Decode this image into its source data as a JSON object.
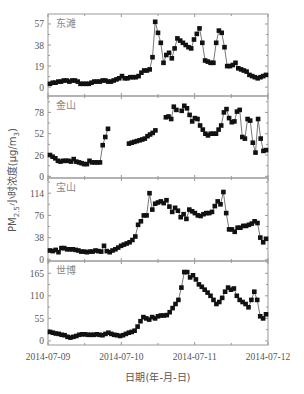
{
  "chart_data": {
    "type": "line",
    "title": "",
    "xlabel": "日期(年-月-日)",
    "ylabel": "PM2.5小时浓度(μg/m3)",
    "ylabel_parts": {
      "main": "PM",
      "sub": "2.5",
      "rest": "小时浓度(μg/m",
      "sub2": "3",
      "close": ")"
    },
    "x_ticks": [
      "2014-07-09",
      "2014-07-10",
      "2014-07-11",
      "2014-07-12"
    ],
    "x_range": [
      0,
      72
    ],
    "marker": "square",
    "grid": false,
    "panels": [
      {
        "name": "东滩",
        "yticks": [
          0,
          19,
          38,
          57
        ],
        "ylim": [
          -8,
          66
        ],
        "values": [
          3,
          4,
          4,
          5,
          5,
          6,
          6,
          5,
          6,
          6,
          5,
          3,
          3,
          3,
          3,
          4,
          5,
          5,
          5,
          6,
          6,
          5,
          5,
          6,
          7,
          8,
          10,
          8,
          8,
          9,
          9,
          9,
          10,
          13,
          15,
          15,
          16,
          27,
          59,
          49,
          40,
          22,
          29,
          31,
          26,
          35,
          44,
          42,
          40,
          38,
          36,
          35,
          43,
          48,
          53,
          40,
          24,
          23,
          22,
          22,
          40,
          51,
          49,
          36,
          19,
          19,
          20,
          22,
          17,
          16,
          15,
          14,
          11,
          10,
          9,
          8,
          9,
          10,
          11
        ]
      },
      {
        "name": "金山",
        "yticks": [
          0,
          26,
          52,
          78
        ],
        "ylim": [
          -2,
          98
        ],
        "values": [
          26,
          24,
          22,
          19,
          18,
          19,
          19,
          19,
          18,
          21,
          18,
          17,
          16,
          15,
          15,
          19,
          17,
          17,
          17,
          17,
          38,
          48,
          58,
          null,
          null,
          null,
          null,
          null,
          null,
          null,
          40,
          41,
          42,
          43,
          44,
          45,
          46,
          49,
          51,
          53,
          56,
          null,
          null,
          null,
          72,
          73,
          70,
          85,
          81,
          null,
          80,
          86,
          83,
          75,
          67,
          71,
          70,
          62,
          57,
          52,
          50,
          52,
          52,
          52,
          57,
          62,
          78,
          82,
          71,
          66,
          67,
          79,
          81,
          48,
          46,
          70,
          68,
          41,
          29,
          70,
          46,
          31,
          32
        ]
      },
      {
        "name": "宝山",
        "yticks": [
          0,
          38,
          76,
          114
        ],
        "ylim": [
          -2,
          140
        ],
        "values": [
          16,
          15,
          17,
          13,
          20,
          20,
          18,
          18,
          18,
          17,
          16,
          14,
          14,
          13,
          14,
          14,
          16,
          15,
          14,
          24,
          15,
          13,
          16,
          18,
          21,
          24,
          26,
          28,
          30,
          34,
          40,
          60,
          66,
          76,
          76,
          114,
          86,
          96,
          98,
          100,
          97,
          102,
          91,
          82,
          89,
          84,
          73,
          78,
          70,
          86,
          83,
          80,
          76,
          75,
          78,
          80,
          80,
          82,
          92,
          100,
          95,
          116,
          80,
          52,
          52,
          48,
          55,
          55,
          58,
          58,
          60,
          62,
          66,
          63,
          38,
          30,
          36
        ]
      },
      {
        "name": "世博",
        "yticks": [
          0,
          55,
          110,
          165
        ],
        "ylim": [
          -10,
          195
        ],
        "values": [
          22,
          20,
          18,
          17,
          15,
          14,
          10,
          8,
          10,
          12,
          15,
          16,
          16,
          15,
          15,
          15,
          16,
          15,
          14,
          17,
          20,
          17,
          15,
          14,
          12,
          14,
          17,
          20,
          22,
          25,
          35,
          48,
          58,
          55,
          52,
          58,
          55,
          60,
          62,
          62,
          63,
          70,
          80,
          90,
          100,
          130,
          168,
          168,
          155,
          160,
          150,
          138,
          132,
          125,
          118,
          110,
          100,
          90,
          95,
          105,
          120,
          130,
          125,
          128,
          110,
          100,
          95,
          90,
          82,
          100,
          120,
          100,
          60,
          55,
          65
        ]
      }
    ]
  },
  "colors": {
    "axis": "#999999",
    "marker": "#111111",
    "line": "#555555"
  }
}
